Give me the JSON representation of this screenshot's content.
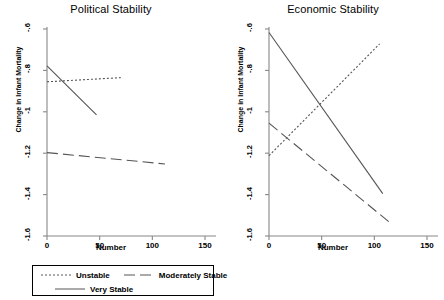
{
  "chart_data": [
    {
      "type": "line",
      "title": "Political Stability",
      "xlabel": "Number",
      "ylabel": "Change in Infant Mortality",
      "xlim": [
        0,
        150
      ],
      "ylim": [
        -1.6,
        -0.6
      ],
      "xticks": [
        0,
        50,
        100,
        150
      ],
      "xtick_labels": [
        "0",
        "50",
        "100",
        "150"
      ],
      "yticks": [
        -0.6,
        -0.8,
        -1.0,
        -1.2,
        -1.4,
        -1.6
      ],
      "ytick_labels": [
        "-.6",
        "-.8",
        "-1",
        "-1.2",
        "-1.4",
        "-1.6"
      ],
      "grid": false,
      "legend_position": "below",
      "series": [
        {
          "name": "Unstable",
          "style": "dotted",
          "x": [
            0,
            70
          ],
          "y": [
            -0.855,
            -0.835
          ]
        },
        {
          "name": "Moderately Stable",
          "style": "dashed",
          "x": [
            0,
            112
          ],
          "y": [
            -1.197,
            -1.252
          ]
        },
        {
          "name": "Very Stable",
          "style": "solid",
          "x": [
            0,
            47
          ],
          "y": [
            -0.778,
            -1.015
          ]
        }
      ]
    },
    {
      "type": "line",
      "title": "Economic Stability",
      "xlabel": "Number",
      "ylabel": "Change in Infant Mortality",
      "xlim": [
        0,
        150
      ],
      "ylim": [
        -1.6,
        -0.6
      ],
      "xticks": [
        0,
        50,
        100,
        150
      ],
      "xtick_labels": [
        "0",
        "50",
        "100",
        "150"
      ],
      "yticks": [
        -0.6,
        -0.8,
        -1.0,
        -1.2,
        -1.4,
        -1.6
      ],
      "ytick_labels": [
        "-.6",
        "-.8",
        "-1",
        "-1.2",
        "-1.4",
        "-1.6"
      ],
      "grid": false,
      "legend_position": "below",
      "series": [
        {
          "name": "Unstable",
          "style": "dotted",
          "x": [
            0,
            105
          ],
          "y": [
            -1.212,
            -0.672
          ]
        },
        {
          "name": "Moderately Stable",
          "style": "dashed",
          "x": [
            0,
            114
          ],
          "y": [
            -1.055,
            -1.532
          ]
        },
        {
          "name": "Very Stable",
          "style": "solid",
          "x": [
            0,
            108
          ],
          "y": [
            -0.617,
            -1.395
          ]
        }
      ]
    }
  ],
  "legend": {
    "entries": [
      {
        "label": "Unstable",
        "style": "dotted"
      },
      {
        "label": "Moderately Stable",
        "style": "dashed"
      },
      {
        "label": "Very Stable",
        "style": "solid"
      }
    ]
  },
  "colors": {
    "line": "#555555",
    "axis": "#888888",
    "text": "#000000",
    "background": "#ffffff"
  }
}
